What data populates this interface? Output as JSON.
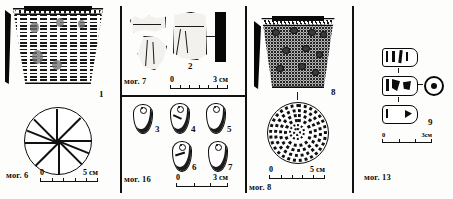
{
  "plate": {
    "title": "Archaeological finds plate",
    "background": "#fdfdfb",
    "ink": "#0b0b0b"
  },
  "panels": [
    {
      "id": "panel-mog-6",
      "grave_label": "мог. 6",
      "figure_numbers": [
        "1"
      ],
      "objects": [
        {
          "name": "comb-stamped-vessel",
          "kind": "ceramic vessel, truncated-cone body with vertical comb-stamp columns",
          "figure": "1"
        },
        {
          "name": "vessel-base-disc",
          "kind": "round base view with radiating spoke lines"
        }
      ],
      "scale": {
        "zero": "0",
        "max": "5",
        "unit": "см"
      }
    },
    {
      "id": "panel-mog-7",
      "grave_label": "мог. 7",
      "figure_numbers": [
        "2"
      ],
      "objects": [
        {
          "name": "sherd-upper-left",
          "kind": "pottery sherd"
        },
        {
          "name": "sherd-lower-left",
          "kind": "pottery sherd"
        },
        {
          "name": "sherd-center",
          "kind": "pottery sherd, figure 2"
        },
        {
          "name": "sherd-profile",
          "kind": "profile section, solid black"
        }
      ],
      "scale": {
        "zero": "0",
        "max": "3",
        "unit": "см"
      }
    },
    {
      "id": "panel-mog-16",
      "grave_label": "мог. 16",
      "figure_numbers": [
        "3",
        "4",
        "5",
        "6",
        "7"
      ],
      "objects": [
        {
          "name": "pendant-3",
          "figure": "3",
          "kind": "perforated teardrop pendant"
        },
        {
          "name": "pendant-4",
          "figure": "4",
          "kind": "perforated teardrop pendant"
        },
        {
          "name": "pendant-5",
          "figure": "5",
          "kind": "perforated teardrop pendant"
        },
        {
          "name": "pendant-6",
          "figure": "6",
          "kind": "perforated teardrop pendant"
        },
        {
          "name": "pendant-7",
          "figure": "7",
          "kind": "perforated teardrop pendant"
        }
      ],
      "scale": {
        "zero": "0",
        "max": "3",
        "unit": "см"
      }
    },
    {
      "id": "panel-mog-8",
      "grave_label": "мог. 8",
      "figure_numbers": [
        "8"
      ],
      "objects": [
        {
          "name": "stippled-vessel",
          "kind": "ceramic vessel with dense stipple decoration and pitted bosses",
          "figure": "8"
        },
        {
          "name": "vessel-base-disc-stippled",
          "kind": "round base view with concentric stippled rings"
        }
      ],
      "scale": {
        "zero": "0",
        "max": "5",
        "unit": "см"
      }
    },
    {
      "id": "panel-mog-13",
      "grave_label": "мог. 13",
      "figure_numbers": [
        "9"
      ],
      "objects": [
        {
          "name": "bead-view-top",
          "kind": "cylindrical bead, side view"
        },
        {
          "name": "bead-view-middle",
          "kind": "cylindrical bead, side view"
        },
        {
          "name": "bead-view-end",
          "kind": "bead, end-on view showing perforation"
        },
        {
          "name": "bead-view-bottom",
          "kind": "cylindrical bead, side view",
          "figure": "9"
        }
      ],
      "scale": {
        "zero": "0",
        "max": "3",
        "unit": "см"
      }
    }
  ]
}
